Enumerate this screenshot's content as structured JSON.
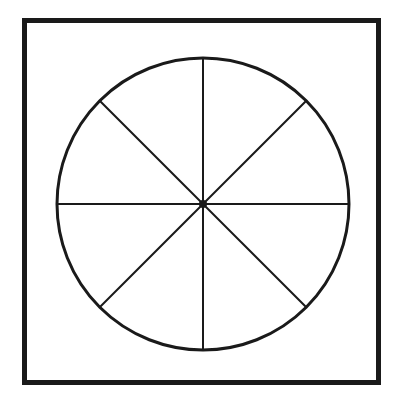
{
  "figure": {
    "background_color": "#ffffff",
    "ink_color": "#1a1a1a",
    "canvas": {
      "width": 403,
      "height": 406
    },
    "frame": {
      "name": "square-border",
      "x": 24,
      "y": 20,
      "width": 354,
      "height": 362,
      "stroke_width": 5,
      "stroke_color": "#1a1a1a",
      "fill_color": "#ffffff"
    },
    "circle": {
      "name": "outer-circle",
      "center_x": 203,
      "center_y": 204,
      "radius": 146,
      "stroke_width": 3,
      "stroke_color": "#1a1a1a",
      "fill_color": "none"
    },
    "center_dot": {
      "name": "center-point",
      "center_x": 203,
      "center_y": 204,
      "radius": 4,
      "fill_color": "#1a1a1a"
    },
    "diameters": [
      {
        "label": "vertical-diameter",
        "angle_deg": 90,
        "x1": 203,
        "y1": 58,
        "x2": 203,
        "y2": 350
      },
      {
        "label": "horizontal-diameter",
        "angle_deg": 0,
        "x1": 57,
        "y1": 204,
        "x2": 349,
        "y2": 204
      },
      {
        "label": "diagonal-diameter-nw-se",
        "angle_deg": 135,
        "x1": 99.7,
        "y1": 100.7,
        "x2": 306.3,
        "y2": 307.3
      },
      {
        "label": "diagonal-diameter-ne-sw",
        "angle_deg": 45,
        "x1": 306.3,
        "y1": 100.7,
        "x2": 99.7,
        "y2": 307.3
      }
    ],
    "diameter_stroke_width": 2,
    "sector_count": 8,
    "sector_angle_deg": 45
  },
  "chart_data": {
    "type": "pie",
    "categories": [
      "1",
      "2",
      "3",
      "4",
      "5",
      "6",
      "7",
      "8"
    ],
    "values": [
      12.5,
      12.5,
      12.5,
      12.5,
      12.5,
      12.5,
      12.5,
      12.5
    ],
    "unit": "percent",
    "slice_angle_deg": 45,
    "labels_shown": false,
    "legend": "none",
    "grid": false
  }
}
